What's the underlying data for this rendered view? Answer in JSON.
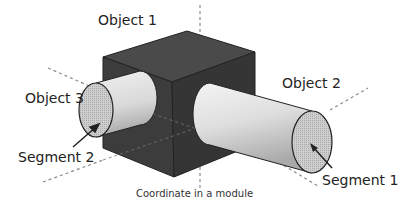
{
  "diagram": {
    "labels": {
      "object1": "Object 1",
      "object2": "Object 2",
      "object3": "Object 3",
      "segment1": "Segment 1",
      "segment2": "Segment 2",
      "caption": "Coordinate in a module"
    },
    "colors": {
      "cube_top": "#4a4a4a",
      "cube_left": "#3c3c3c",
      "cube_right": "#353535",
      "cylinder": "#dcdcdc",
      "cap": "#c4c4c4",
      "axis": "#888888"
    }
  }
}
